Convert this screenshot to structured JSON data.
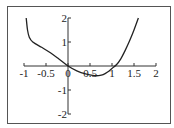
{
  "chart_data": {
    "type": "line",
    "title": "",
    "xlabel": "",
    "ylabel": "",
    "xlim": [
      -1,
      2
    ],
    "ylim": [
      -2,
      2
    ],
    "grid": false,
    "legend": null,
    "x_ticks": [
      "-1",
      "-0.5",
      "0",
      "0.5",
      "1",
      "1.5",
      "2"
    ],
    "y_ticks": [
      "2",
      "1",
      "-1",
      "-2"
    ],
    "series": [
      {
        "name": "f(x)",
        "color": "#222222",
        "x": [
          -0.95,
          -0.92,
          -0.88,
          -0.8,
          -0.6,
          -0.4,
          -0.2,
          0,
          0.2,
          0.4,
          0.6,
          0.7,
          0.8,
          0.9,
          1.0,
          1.1,
          1.2,
          1.3,
          1.4,
          1.5,
          1.6
        ],
        "y": [
          2.0,
          1.5,
          1.2,
          1.0,
          0.78,
          0.55,
          0.28,
          0.0,
          -0.2,
          -0.33,
          -0.4,
          -0.4,
          -0.36,
          -0.25,
          -0.1,
          0.05,
          0.3,
          0.65,
          1.05,
          1.5,
          2.0
        ]
      }
    ]
  }
}
